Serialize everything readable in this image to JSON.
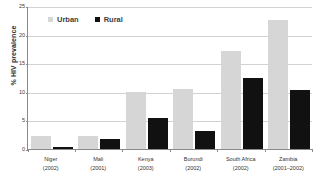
{
  "chart_data": {
    "type": "bar",
    "title": "",
    "xlabel": "",
    "ylabel": "% HIV prevalence",
    "ylim": [
      0,
      25
    ],
    "yticks": [
      0,
      5,
      10,
      15,
      20,
      25
    ],
    "grid": true,
    "legend_position": "top-left",
    "categories": [
      {
        "name": "Niger",
        "year": "(2002)"
      },
      {
        "name": "Mali",
        "year": "(2001)"
      },
      {
        "name": "Kenya",
        "year": "(2003)"
      },
      {
        "name": "Burundi",
        "year": "(2002)"
      },
      {
        "name": "South Africa",
        "year": "(2002)"
      },
      {
        "name": "Zambia",
        "year": "(2001–2002)"
      }
    ],
    "series": [
      {
        "name": "Urban",
        "color": "#d6d6d6",
        "values": [
          2.2,
          2.2,
          10.0,
          10.5,
          17.1,
          22.5
        ]
      },
      {
        "name": "Rural",
        "color": "#111111",
        "values": [
          0.4,
          1.7,
          5.4,
          3.2,
          12.4,
          10.3
        ]
      }
    ]
  },
  "legend": {
    "urban_label": "Urban",
    "rural_label": "Rural"
  }
}
